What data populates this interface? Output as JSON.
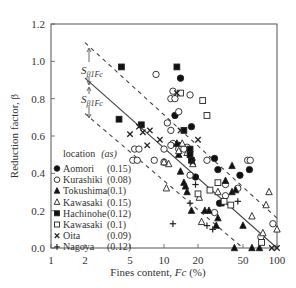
{
  "chart_data": {
    "type": "scatter",
    "title": "",
    "xlabel": "Fines content, Fc (%)",
    "ylabel": "Reduction factor, β",
    "xscale": "log",
    "xlim": [
      1,
      100
    ],
    "ylim": [
      0.0,
      1.2
    ],
    "xticks": [
      1,
      2,
      5,
      10,
      20,
      50,
      100
    ],
    "xtick_labels": [
      "1",
      "2",
      "5",
      "10",
      "20",
      "50",
      "100"
    ],
    "yticks": [
      0.0,
      0.2,
      0.4,
      0.6,
      0.8,
      1.0,
      1.2
    ],
    "ytick_labels": [
      "0.0",
      "0.2",
      "0.4",
      "0.6",
      "0.8",
      "1.0",
      "1.2"
    ],
    "grid": false,
    "legend_position": "lower-left inside",
    "legend_title": "location  (as)",
    "annotations": [
      {
        "text": "Sβ1Fc",
        "x": 2.0,
        "y": 1.0,
        "note": "upper band width arrow"
      },
      {
        "text": "Sβ1Fc",
        "x": 2.0,
        "y": 0.8,
        "note": "lower band width arrow"
      }
    ],
    "lines": [
      {
        "name": "regression",
        "style": "solid",
        "x": [
          2.0,
          100
        ],
        "y": [
          0.91,
          0.0
        ]
      },
      {
        "name": "upper bound (+Sβ1Fc)",
        "style": "dashed",
        "x": [
          2.0,
          100
        ],
        "y": [
          1.1,
          0.16
        ]
      },
      {
        "name": "lower bound (-Sβ1Fc)",
        "style": "dashed",
        "x": [
          2.0,
          50
        ],
        "y": [
          0.72,
          0.0
        ]
      }
    ],
    "series": [
      {
        "name": "Aomori",
        "as": "(0.15)",
        "marker": "filled-circle",
        "x": [
          14,
          12.5,
          17.5,
          13.5,
          19,
          28,
          30,
          31,
          47,
          57
        ],
        "y": [
          0.91,
          0.71,
          0.65,
          0.55,
          0.38,
          0.48,
          0.42,
          0.24,
          0.39,
          0.42
        ]
      },
      {
        "name": "Kurashiki",
        "as": "(0.08)",
        "marker": "open-circle",
        "x": [
          8.5,
          12,
          17,
          11.5,
          12.5,
          5.5,
          6,
          5.3,
          5.8,
          8.2,
          10,
          10.7,
          13.5,
          11.5,
          12,
          16,
          13.5,
          10,
          15,
          17,
          11.5,
          24,
          35,
          45,
          28,
          35,
          72,
          55,
          92,
          58
        ],
        "y": [
          0.93,
          0.84,
          0.82,
          0.8,
          0.8,
          0.53,
          0.53,
          0.47,
          0.47,
          0.47,
          0.53,
          0.67,
          0.73,
          0.63,
          0.56,
          0.54,
          0.53,
          0.46,
          0.53,
          0.39,
          0.55,
          0.47,
          0.34,
          0.32,
          0.19,
          0.28,
          0.06,
          0.47,
          0.13,
          0.47
        ]
      },
      {
        "name": "Tokushima",
        "as": "(0.1)",
        "marker": "filled-triangle",
        "x": [
          13,
          13.5,
          14,
          15,
          15.5,
          16,
          17.5,
          23,
          25,
          29,
          30,
          32,
          35,
          40,
          43,
          40,
          50,
          60,
          70,
          42
        ],
        "y": [
          0.56,
          0.5,
          0.41,
          0.35,
          0.33,
          0.3,
          0.2,
          0.2,
          0.2,
          0.12,
          0.16,
          0.24,
          0.36,
          0.3,
          0.31,
          0.44,
          0.12,
          0.0,
          0.0,
          0.0
        ]
      },
      {
        "name": "Kawasaki",
        "as": "(0.15)",
        "marker": "open-triangle",
        "x": [
          14.5,
          13.5,
          11,
          16,
          18,
          10,
          10.5,
          20.5,
          21.5,
          30,
          60,
          75,
          80,
          85,
          100
        ],
        "y": [
          0.56,
          0.52,
          0.45,
          0.51,
          0.45,
          0.46,
          0.32,
          0.27,
          0.14,
          0.3,
          0.17,
          0.08,
          0.23,
          0.3,
          0.1
        ]
      },
      {
        "name": "Hachinohe",
        "as": "(0.12)",
        "marker": "filled-square",
        "x": [
          4.2,
          4.0,
          6.3,
          13,
          15,
          17,
          17,
          17.5
        ],
        "y": [
          0.97,
          0.69,
          0.66,
          0.97,
          0.63,
          0.53,
          0.5,
          0.47
        ]
      },
      {
        "name": "Kawasaki",
        "as": "(0.1)",
        "marker": "open-square",
        "x": [
          14,
          22,
          24,
          25.5,
          30,
          34,
          39,
          20,
          73
        ],
        "y": [
          0.83,
          0.79,
          0.71,
          0.31,
          0.35,
          0.25,
          0.23,
          0.29,
          0.03
        ]
      },
      {
        "name": "Oita",
        "as": "(0.09)",
        "marker": "cross-x",
        "x": [
          5.0,
          6.5,
          6.0,
          7.5,
          7.1,
          9.2,
          13,
          14,
          20,
          18,
          100,
          90
        ],
        "y": [
          0.61,
          0.62,
          0.65,
          0.63,
          0.55,
          0.58,
          0.83,
          0.63,
          0.58,
          0.46,
          0.0,
          0.0
        ]
      },
      {
        "name": "Nagoya",
        "as": "(0.12)",
        "marker": "plus",
        "x": [
          17,
          19,
          12,
          24,
          27,
          45
        ],
        "y": [
          0.24,
          0.34,
          0.13,
          0.12,
          0.1,
          0.25
        ]
      }
    ]
  },
  "axes": {
    "xlabel_prefix": "Fines content, ",
    "xlabel_var": "Fc",
    "xlabel_suffix": " (%)",
    "ylabel": "Reduction factor, β"
  },
  "annotations": {
    "upper_label_main": "S",
    "upper_label_sub": "β1Fc",
    "lower_label_main": "S",
    "lower_label_sub": "β1Fc"
  },
  "legend": {
    "title": "location",
    "title_paren": "(as)",
    "items": [
      {
        "marker": "filled-circle",
        "label": "Aomori",
        "value": "(0.15)"
      },
      {
        "marker": "open-circle",
        "label": "Kurashiki",
        "value": "(0.08)"
      },
      {
        "marker": "filled-triangle",
        "label": "Tokushima",
        "value": "(0.1)"
      },
      {
        "marker": "open-triangle",
        "label": "Kawasaki",
        "value": "(0.15)"
      },
      {
        "marker": "filled-square",
        "label": "Hachinohe",
        "value": "(0.12)"
      },
      {
        "marker": "open-square",
        "label": "Kawasaki",
        "value": "(0.1)"
      },
      {
        "marker": "cross-x",
        "label": "Oita",
        "value": "(0.09)"
      },
      {
        "marker": "plus",
        "label": "Nagoya",
        "value": "(0.12)"
      }
    ]
  }
}
